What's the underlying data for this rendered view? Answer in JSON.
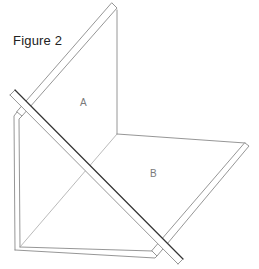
{
  "figure": {
    "title": "Figure 2",
    "panel_labels": {
      "a": "A",
      "b": "B"
    },
    "colors": {
      "background": "#ffffff",
      "line": "#8a8a8a",
      "rod_dark_edge": "#333333",
      "text": "#222222",
      "label": "#7a7a7a"
    }
  }
}
